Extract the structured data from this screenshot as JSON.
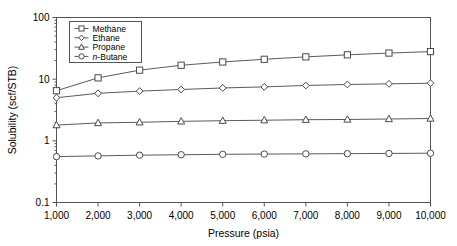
{
  "chart_data": {
    "type": "line",
    "title": "",
    "xlabel": "Pressure (psia)",
    "ylabel": "Solubility (scf/STB)",
    "x": [
      1000,
      2000,
      3000,
      4000,
      5000,
      6000,
      7000,
      8000,
      9000,
      10000
    ],
    "xtick_labels": [
      "1,000",
      "2,000",
      "3,000",
      "4,000",
      "5,000",
      "6,000",
      "7,000",
      "8,000",
      "9,000",
      "10,000"
    ],
    "ytick_labels": [
      "0.1",
      "1",
      "10",
      "100"
    ],
    "ytick_values": [
      0.1,
      1,
      10,
      100
    ],
    "yscale": "log",
    "xlim": [
      1000,
      10000
    ],
    "ylim": [
      0.1,
      100
    ],
    "grid": false,
    "legend_position": "top-left",
    "series": [
      {
        "name": "Methane",
        "marker": "square",
        "values": [
          6.5,
          10.5,
          14.0,
          16.8,
          19.0,
          21.0,
          23.0,
          24.8,
          26.5,
          28.0
        ]
      },
      {
        "name": "Ethane",
        "marker": "diamond",
        "values": [
          5.0,
          5.9,
          6.4,
          6.8,
          7.2,
          7.5,
          7.9,
          8.2,
          8.4,
          8.6
        ]
      },
      {
        "name": "Propane",
        "marker": "triangle",
        "values": [
          1.8,
          1.95,
          2.0,
          2.07,
          2.12,
          2.16,
          2.2,
          2.22,
          2.26,
          2.3
        ]
      },
      {
        "name": "n-Butane",
        "marker": "circle",
        "values": [
          0.555,
          0.57,
          0.585,
          0.595,
          0.605,
          0.61,
          0.615,
          0.62,
          0.625,
          0.63
        ]
      }
    ],
    "legend_entries": [
      {
        "label": "Methane",
        "marker": "square",
        "italic_prefix": ""
      },
      {
        "label": "Ethane",
        "marker": "diamond",
        "italic_prefix": ""
      },
      {
        "label": "Propane",
        "marker": "triangle",
        "italic_prefix": ""
      },
      {
        "label": "-Butane",
        "marker": "circle",
        "italic_prefix": "n"
      }
    ],
    "colors": {
      "line": "#5a5a5a",
      "marker_stroke": "#4a4a4a",
      "marker_fill": "#ffffff",
      "axis": "#555555",
      "text": "#000000",
      "background": "#ffffff"
    }
  }
}
